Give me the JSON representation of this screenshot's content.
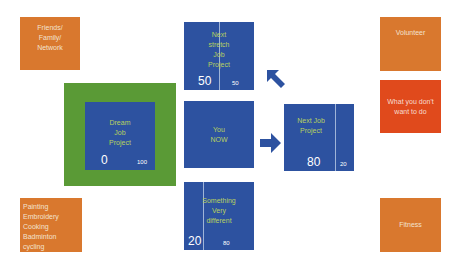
{
  "diagram": {
    "side_boxes": {
      "friends": {
        "lines": [
          "Friends/",
          "Family/",
          "Network"
        ],
        "color": "#d9782e"
      },
      "hobbies": {
        "lines": [
          "Painting",
          "Embroidery",
          "Cooking",
          "Badminton",
          "cycling"
        ],
        "color": "#d9782e"
      },
      "volunteer": {
        "lines": [
          "Volunteer"
        ],
        "color": "#d9782e"
      },
      "dont_want": {
        "lines": [
          "What you don't",
          "want to do"
        ],
        "color": "#e04a1c"
      },
      "fitness": {
        "lines": [
          "Fitness"
        ],
        "color": "#d9782e"
      }
    },
    "job_boxes": {
      "next_stretch": {
        "lines": [
          "Next",
          "stretch",
          "Job",
          "Project"
        ],
        "left_value": "50",
        "right_value": "50"
      },
      "dream": {
        "lines": [
          "Dream",
          "Job",
          "Project"
        ],
        "left_value": "0",
        "right_value": "100"
      },
      "you_now": {
        "lines": [
          "You",
          "NOW"
        ]
      },
      "next_job": {
        "lines": [
          "Next Job",
          "Project"
        ],
        "left_value": "80",
        "right_value": "20"
      },
      "something_different": {
        "lines": [
          "Something",
          "Very",
          "different"
        ],
        "left_value": "20",
        "right_value": "80"
      }
    },
    "colors": {
      "blue": "#2d52a0",
      "green": "#5a9a36",
      "orange": "#d9782e",
      "red": "#e04a1c",
      "label_text": "#b8d160"
    },
    "arrows": [
      "arrow-up-left",
      "arrow-right"
    ]
  }
}
